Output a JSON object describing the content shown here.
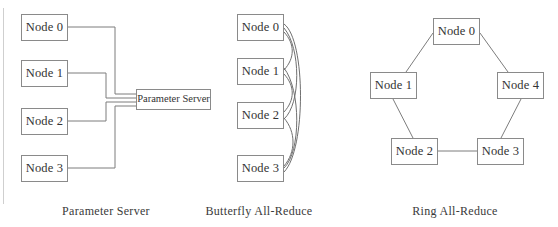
{
  "figure": {
    "width": 558,
    "height": 227,
    "background_color": "#ffffff",
    "line_color": "#7d7d7d",
    "box_border_color": "#8a8a8a",
    "text_color": "#333333"
  },
  "panels": [
    {
      "id": "parameter-server",
      "caption": "Parameter Server",
      "caption_x": 106,
      "caption_y": 204,
      "nodes": [
        {
          "label": "Node 0",
          "x": 21,
          "y": 14,
          "w": 47,
          "h": 27
        },
        {
          "label": "Node 1",
          "x": 21,
          "y": 60,
          "w": 47,
          "h": 27
        },
        {
          "label": "Node 2",
          "x": 21,
          "y": 108,
          "w": 47,
          "h": 27
        },
        {
          "label": "Node 3",
          "x": 21,
          "y": 155,
          "w": 47,
          "h": 27
        }
      ],
      "server": {
        "label": "Parameter Server",
        "x": 136,
        "y": 89,
        "w": 75,
        "h": 21
      },
      "edges": [
        {
          "from": "Node 0",
          "to": "Parameter Server",
          "path": "M 68 27 L 115 27 L 115 94 L 136 94"
        },
        {
          "from": "Node 1",
          "to": "Parameter Server",
          "path": "M 68 73 L 106 73 L 106 98 L 136 98"
        },
        {
          "from": "Node 2",
          "to": "Parameter Server",
          "path": "M 68 121 L 106 121 L 106 102 L 136 102"
        },
        {
          "from": "Node 3",
          "to": "Parameter Server",
          "path": "M 68 168 L 115 168 L 115 106 L 136 106"
        }
      ]
    },
    {
      "id": "butterfly-all-reduce",
      "caption": "Butterfly All-Reduce",
      "caption_x": 259,
      "caption_y": 204,
      "nodes": [
        {
          "label": "Node 0",
          "x": 237,
          "y": 14,
          "w": 47,
          "h": 27
        },
        {
          "label": "Node 1",
          "x": 237,
          "y": 58,
          "w": 47,
          "h": 27
        },
        {
          "label": "Node 2",
          "x": 237,
          "y": 102,
          "w": 47,
          "h": 27
        },
        {
          "label": "Node 3",
          "x": 237,
          "y": 155,
          "w": 47,
          "h": 27
        }
      ],
      "edges": [
        {
          "from": "Node 0",
          "to": "Node 3",
          "path": "M 284 24 C 306 40, 306 150, 284 172"
        },
        {
          "from": "Node 0",
          "to": "Node 2",
          "path": "M 284 28 C 301 48, 301 104, 284 119"
        },
        {
          "from": "Node 1",
          "to": "Node 3",
          "path": "M 284 68 C 301 90, 301 152, 284 168"
        },
        {
          "from": "Node 0",
          "to": "Node 1",
          "path": "M 284 32 C 295 44, 295 58, 284 70"
        },
        {
          "from": "Node 1",
          "to": "Node 2",
          "path": "M 284 74 C 295 86, 295 100, 284 112"
        },
        {
          "from": "Node 2",
          "to": "Node 3",
          "path": "M 284 118 C 296 132, 296 152, 284 166"
        }
      ]
    },
    {
      "id": "ring-all-reduce",
      "caption": "Ring All-Reduce",
      "caption_x": 455,
      "caption_y": 204,
      "nodes": [
        {
          "label": "Node 0",
          "x": 433,
          "y": 18,
          "w": 47,
          "h": 27
        },
        {
          "label": "Node 1",
          "x": 370,
          "y": 72,
          "w": 47,
          "h": 27
        },
        {
          "label": "Node 4",
          "x": 497,
          "y": 72,
          "w": 47,
          "h": 27
        },
        {
          "label": "Node 2",
          "x": 391,
          "y": 138,
          "w": 47,
          "h": 27
        },
        {
          "label": "Node 3",
          "x": 477,
          "y": 138,
          "w": 47,
          "h": 27
        }
      ],
      "edges": [
        {
          "from": "Node 0",
          "to": "Node 1",
          "path": "M 433 33 L 406 72"
        },
        {
          "from": "Node 0",
          "to": "Node 4",
          "path": "M 480 33 L 508 72"
        },
        {
          "from": "Node 1",
          "to": "Node 2",
          "path": "M 393 99 L 413 138"
        },
        {
          "from": "Node 4",
          "to": "Node 3",
          "path": "M 521 99 L 501 138"
        },
        {
          "from": "Node 2",
          "to": "Node 3",
          "path": "M 438 151 L 477 151"
        }
      ]
    }
  ]
}
